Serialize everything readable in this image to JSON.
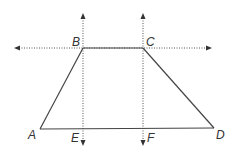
{
  "diagram": {
    "vertices": {
      "A": "A",
      "B": "B",
      "C": "C",
      "D": "D",
      "E": "E",
      "F": "F"
    },
    "segments": [
      {
        "name": "AB",
        "style": "solid"
      },
      {
        "name": "BC",
        "style": "solid"
      },
      {
        "name": "CD",
        "style": "solid"
      },
      {
        "name": "AD",
        "style": "solid"
      }
    ],
    "lines": [
      {
        "name": "line-BC",
        "style": "dotted",
        "arrows": "both",
        "orientation": "horizontal"
      },
      {
        "name": "line-BE",
        "style": "dotted",
        "arrows": "both",
        "orientation": "vertical"
      },
      {
        "name": "line-CF",
        "style": "dotted",
        "arrows": "both",
        "orientation": "vertical"
      }
    ]
  }
}
